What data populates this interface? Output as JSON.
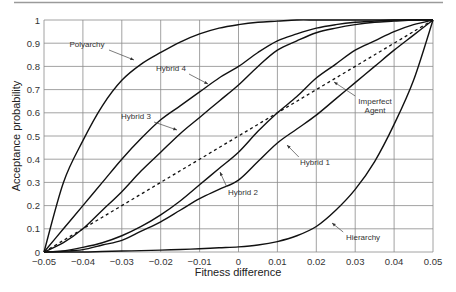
{
  "chart_data": {
    "type": "line",
    "title": "",
    "xlabel": "Fitness difference",
    "ylabel": "Acceptance probability",
    "xlim": [
      -0.05,
      0.05
    ],
    "ylim": [
      0,
      1
    ],
    "grid": true,
    "legend": "inline labels with arrows",
    "x_ticks": [
      "-0.05",
      "-0.04",
      "-0.03",
      "-0.02",
      "-0.01",
      "0",
      "0.01",
      "0.02",
      "0.03",
      "0.04",
      "0.05"
    ],
    "y_ticks": [
      "0",
      "0.1",
      "0.2",
      "0.3",
      "0.4",
      "0.5",
      "0.6",
      "0.7",
      "0.8",
      "0.9",
      "1"
    ],
    "x": [
      -0.05,
      -0.045,
      -0.04,
      -0.035,
      -0.03,
      -0.025,
      -0.02,
      -0.015,
      -0.01,
      -0.005,
      0,
      0.005,
      0.01,
      0.015,
      0.02,
      0.025,
      0.03,
      0.035,
      0.04,
      0.045,
      0.05
    ],
    "series": [
      {
        "name": "Polyarchy",
        "style": "solid",
        "values": [
          0,
          0.3,
          0.48,
          0.63,
          0.74,
          0.81,
          0.86,
          0.905,
          0.94,
          0.965,
          0.98,
          0.99,
          0.995,
          1.0,
          1.0,
          1.0,
          1.0,
          1.0,
          1.0,
          1.0,
          1.0
        ]
      },
      {
        "name": "Hybrid 4",
        "style": "solid",
        "values": [
          0,
          0.1,
          0.2,
          0.3,
          0.4,
          0.49,
          0.57,
          0.63,
          0.69,
          0.75,
          0.8,
          0.86,
          0.91,
          0.94,
          0.965,
          0.98,
          0.99,
          0.995,
          1.0,
          1.0,
          1.0
        ]
      },
      {
        "name": "Hybrid 3",
        "style": "solid",
        "values": [
          0,
          0.04,
          0.1,
          0.18,
          0.26,
          0.35,
          0.43,
          0.51,
          0.58,
          0.65,
          0.72,
          0.8,
          0.87,
          0.91,
          0.945,
          0.965,
          0.98,
          0.99,
          0.995,
          1.0,
          1.0
        ]
      },
      {
        "name": "Imperfect Agent",
        "style": "dashed",
        "values": [
          0,
          0.05,
          0.1,
          0.15,
          0.2,
          0.25,
          0.3,
          0.35,
          0.4,
          0.45,
          0.5,
          0.55,
          0.6,
          0.65,
          0.7,
          0.75,
          0.8,
          0.85,
          0.9,
          0.95,
          1.0
        ]
      },
      {
        "name": "Hybrid 2",
        "style": "solid",
        "values": [
          0,
          0.005,
          0.02,
          0.04,
          0.07,
          0.11,
          0.16,
          0.22,
          0.29,
          0.36,
          0.43,
          0.52,
          0.6,
          0.67,
          0.75,
          0.81,
          0.87,
          0.91,
          0.95,
          0.98,
          1.0
        ]
      },
      {
        "name": "Hybrid 1",
        "style": "solid",
        "values": [
          0,
          0.003,
          0.01,
          0.03,
          0.05,
          0.09,
          0.13,
          0.18,
          0.23,
          0.27,
          0.31,
          0.39,
          0.47,
          0.53,
          0.59,
          0.66,
          0.73,
          0.8,
          0.87,
          0.935,
          1.0
        ]
      },
      {
        "name": "Hierarchy",
        "style": "solid",
        "values": [
          0,
          0,
          0,
          0.002,
          0.004,
          0.006,
          0.008,
          0.011,
          0.014,
          0.018,
          0.022,
          0.03,
          0.045,
          0.07,
          0.11,
          0.18,
          0.27,
          0.39,
          0.55,
          0.74,
          1.0
        ]
      }
    ],
    "annotations": [
      {
        "text": "Polyarchy",
        "x": 87,
        "y": 47,
        "ax": 134,
        "ay": 60
      },
      {
        "text": "Hybrid 4",
        "x": 171,
        "y": 71,
        "ax": 208,
        "ay": 84
      },
      {
        "text": "Hybrid 3",
        "x": 136,
        "y": 119,
        "ax": 177,
        "ay": 130
      },
      {
        "text": "Imperfect",
        "x": 375,
        "y": 104,
        "ax": 334,
        "ay": 82
      },
      {
        "text": "Agent",
        "x": 375,
        "y": 113,
        "ax": null,
        "ay": null
      },
      {
        "text": "Hybrid 1",
        "x": 315,
        "y": 165,
        "ax": 287,
        "ay": 145
      },
      {
        "text": "Hybrid 2",
        "x": 243,
        "y": 195,
        "ax": 220,
        "ay": 172
      },
      {
        "text": "Hierarchy",
        "x": 363,
        "y": 240,
        "ax": 332,
        "ay": 223
      }
    ]
  },
  "page": {
    "top_rule_color": "#9a9a9a",
    "grid_color": "#8a8a8a",
    "curve_color": "#111111"
  }
}
